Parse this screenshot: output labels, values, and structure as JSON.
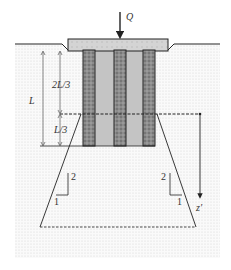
{
  "figure": {
    "type": "pile-group-load-distribution",
    "labels": {
      "load": "Q",
      "total_length": "L",
      "upper_length": "2L/3",
      "lower_length": "L/3",
      "depth": "z′",
      "slope_left_rise": "2",
      "slope_left_run": "1",
      "slope_right_rise": "2",
      "slope_right_run": "1"
    },
    "colors": {
      "soil_dots": "#d8d8d8",
      "pile_fill": "#8a8a8a",
      "pile_core_fill": "#c0c0c0",
      "cap_fill": "#d6d6d6",
      "line": "#222222"
    },
    "piles_count": 3
  }
}
